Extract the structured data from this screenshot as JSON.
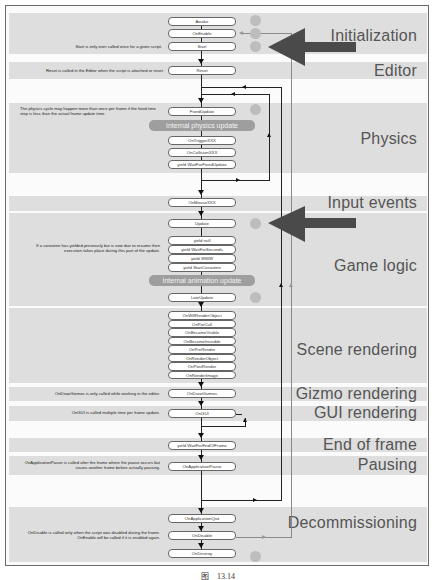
{
  "sections": [
    {
      "id": "initialization",
      "label": "Initialization"
    },
    {
      "id": "editor",
      "label": "Editor"
    },
    {
      "id": "physics",
      "label": "Physics"
    },
    {
      "id": "input-events",
      "label": "Input events"
    },
    {
      "id": "game-logic",
      "label": "Game logic"
    },
    {
      "id": "scene-rendering",
      "label": "Scene rendering"
    },
    {
      "id": "gizmo-rendering",
      "label": "Gizmo rendering"
    },
    {
      "id": "gui-rendering",
      "label": "GUI rendering"
    },
    {
      "id": "end-of-frame",
      "label": "End of frame"
    },
    {
      "id": "pausing",
      "label": "Pausing"
    },
    {
      "id": "decommissioning",
      "label": "Decommissioning"
    }
  ],
  "nodes": {
    "awake": "Awake",
    "on_enable": "OnEnable",
    "start": "Start",
    "reset": "Reset",
    "fixed_update": "FixedUpdate",
    "internal_physics_update": "Internal physics update",
    "on_trigger_xxx": "OnTriggerXXX",
    "on_collision_xxx": "OnCollisionXXX",
    "yield_wait_for_fixed_update": "yield WaitForFixedUpdate",
    "on_mouse_xxx": "OnMouseXXX",
    "update": "Update",
    "yield_null": "yield null",
    "yield_wait_for_seconds": "yield WaitForSeconds",
    "yield_www": "yield WWW",
    "yield_start_coroutine": "yield StartCoroutine",
    "internal_animation_update": "Internal animation update",
    "late_update": "LateUpdate",
    "on_will_render_object": "OnWillRenderObject",
    "on_pre_cull": "OnPreCull",
    "on_became_visible": "OnBecameVisible",
    "on_became_invisible": "OnBecameInvisible",
    "on_pre_render": "OnPreRender",
    "on_render_object": "OnRenderObject",
    "on_post_render": "OnPostRender",
    "on_render_image": "OnRenderImage",
    "on_draw_gizmos": "OnDrawGizmos",
    "on_gui": "OnGUI",
    "yield_wait_for_end_of_frame": "yield WaitForEndOfFrame",
    "on_application_pause": "OnApplicationPause",
    "on_application_quit": "OnApplicationQuit",
    "on_disable": "OnDisable",
    "on_destroy": "OnDestroy"
  },
  "notes": {
    "start": "Start is only ever called once for a given script.",
    "reset": "Reset is called in the Editor when the script is attached or reset.",
    "physics": "The physics cycle may happen more than once per frame if the fixed time step is less than the actual frame update time.",
    "coroutine": "If a coroutine has yielded previously but is now due to resume then execution takes place during this part of the update.",
    "gizmos": "OnDrawGizmos is only called while working in the editor.",
    "gui": "OnGUI is called multiple time per frame update.",
    "pause": "OnApplicationPause is called after the frame where the pause occurs but issues another frame before actually pausing.",
    "disable": "OnDisable is called only when the script was disabled during the frame. OnEnable will be called if it is enabled again."
  },
  "caption": {
    "prefix": "图",
    "number": "13.14"
  },
  "colors": {
    "band": "#dedede",
    "pill": "#9e9e9e",
    "dot": "#bdbdbd",
    "big_arrow": "#4a4a4a",
    "line_dark": "#222222",
    "line_light": "#8a8a8a"
  }
}
